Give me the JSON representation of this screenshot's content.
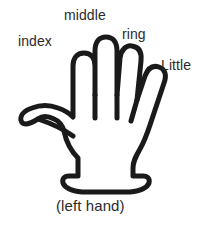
{
  "figure": {
    "title": "(left hand)",
    "caption": "(left hand)",
    "background_color": "#ffffff",
    "outline_color": "#1a1a1a",
    "fill_color": "#ffffff",
    "text_color": "#2b2b2b",
    "labels": [
      {
        "id": "index",
        "text": "index"
      },
      {
        "id": "middle",
        "text": "middle"
      },
      {
        "id": "ring",
        "text": "ring"
      },
      {
        "id": "little",
        "text": "Little"
      }
    ],
    "icons": {
      "hand": "hand-outline-icon"
    }
  }
}
